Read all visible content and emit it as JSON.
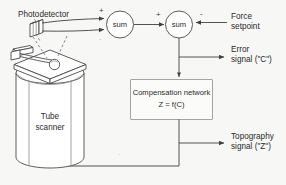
{
  "diagram": {
    "background_color": "#f7f7f5",
    "line_color": "#3f3f3f",
    "text_color": "#2b2b2b",
    "labels": {
      "photodetector": "Photodetector",
      "sum_1": "sum",
      "sum_2": "sum",
      "force_setpoint_line1": "Force",
      "force_setpoint_line2": "setpoint",
      "error_signal_line1": "Error",
      "error_signal_line2": "signal (\"C\")",
      "compensation_line1": "Compensation network",
      "compensation_line2": "Z = f(C)",
      "topography_line1": "Topography",
      "topography_line2": "signal (\"Z\")",
      "tube_scanner_line1": "Tube",
      "tube_scanner_line2": "scanner"
    },
    "signs": {
      "sum1_plus": "+",
      "sum1_minus": "-",
      "sum2_plus": "+",
      "sum2_minus": "-",
      "stray_mark": "."
    },
    "nodes": [
      {
        "name": "photodetector",
        "type": "sensor"
      },
      {
        "name": "sum-1",
        "type": "summing-junction"
      },
      {
        "name": "sum-2",
        "type": "summing-junction"
      },
      {
        "name": "compensation-network",
        "type": "block"
      },
      {
        "name": "tube-scanner",
        "type": "actuator"
      }
    ],
    "connections": [
      {
        "from": "photodetector",
        "to": "sum-1",
        "sign": "+"
      },
      {
        "from": "photodetector",
        "to": "sum-1",
        "sign": "-"
      },
      {
        "from": "sum-1",
        "to": "sum-2",
        "sign": "+"
      },
      {
        "from": "force-setpoint",
        "to": "sum-2",
        "sign": "-"
      },
      {
        "from": "sum-2",
        "to": "error-signal-output",
        "sign": ""
      },
      {
        "from": "sum-2",
        "to": "compensation-network",
        "sign": ""
      },
      {
        "from": "compensation-network",
        "to": "topography-output",
        "sign": ""
      },
      {
        "from": "compensation-network",
        "to": "tube-scanner",
        "sign": ""
      }
    ]
  }
}
